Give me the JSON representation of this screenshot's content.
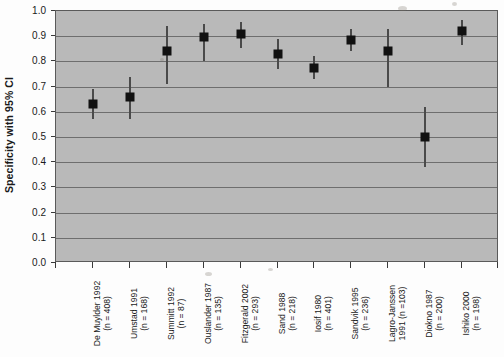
{
  "chart_data": {
    "type": "scatter",
    "title": "",
    "xlabel": "",
    "ylabel": "Specificity with 95% CI",
    "ylim": [
      0.0,
      1.0
    ],
    "ytick_labels": [
      "0.0",
      "0.1",
      "0.2",
      "0.3",
      "0.4",
      "0.5",
      "0.6",
      "0.7",
      "0.8",
      "0.9",
      "1.0"
    ],
    "ytick_values": [
      0.0,
      0.1,
      0.2,
      0.3,
      0.4,
      0.5,
      0.6,
      0.7,
      0.8,
      0.9,
      1.0
    ],
    "grid": true,
    "legend": "none",
    "marker": "filled-square",
    "error_bars": "95% CI vertical whisker-less lines",
    "categories": [
      "De Muylder 1992 (n = 408)",
      "Umstad 1991 (n = 168)",
      "Summitt 1992 (n = 87)",
      "Ouslander 1987 (n = 135)",
      "Fitzgerald 2002 (n = 293)",
      "Sand 1988 (n = 218)",
      "Iosif 1980 (n = 401)",
      "Sandvik 1995 (n = 236)",
      "Lagro-Janssen 1991 (n =103)",
      "Diokno 1987 (n = 200)",
      "Ishiko 2000 (n = 198)"
    ],
    "points": [
      {
        "label": "De Muylder 1992",
        "n": 408,
        "label_line1": "De Muylder 1992",
        "label_line2": "(n = 408)",
        "value": 0.63,
        "ci_low": 0.57,
        "ci_high": 0.69
      },
      {
        "label": "Umstad 1991",
        "n": 168,
        "label_line1": "Umstad 1991",
        "label_line2": "(n = 168)",
        "value": 0.66,
        "ci_low": 0.57,
        "ci_high": 0.74
      },
      {
        "label": "Summitt 1992",
        "n": 87,
        "label_line1": "Summitt 1992",
        "label_line2": "(n = 87)",
        "value": 0.84,
        "ci_low": 0.71,
        "ci_high": 0.94
      },
      {
        "label": "Ouslander 1987",
        "n": 135,
        "label_line1": "Ouslander 1987",
        "label_line2": "(n = 135)",
        "value": 0.895,
        "ci_low": 0.8,
        "ci_high": 0.95
      },
      {
        "label": "Fitzgerald 2002",
        "n": 293,
        "label_line1": "Fitzgerald 2002",
        "label_line2": "(n = 293)",
        "value": 0.91,
        "ci_low": 0.855,
        "ci_high": 0.955
      },
      {
        "label": "Sand 1988",
        "n": 218,
        "label_line1": "Sand 1988",
        "label_line2": "(n = 218)",
        "value": 0.83,
        "ci_low": 0.77,
        "ci_high": 0.89
      },
      {
        "label": "Iosif 1980",
        "n": 401,
        "label_line1": "Iosif 1980",
        "label_line2": "(n = 401)",
        "value": 0.775,
        "ci_low": 0.73,
        "ci_high": 0.82
      },
      {
        "label": "Sandvik 1995",
        "n": 236,
        "label_line1": "Sandvik 1995",
        "label_line2": "(n = 236)",
        "value": 0.885,
        "ci_low": 0.84,
        "ci_high": 0.93
      },
      {
        "label": "Lagro-Janssen 1991",
        "n": 103,
        "label_line1": "Lagro-Janssen",
        "label_line2": "1991 (n =103)",
        "value": 0.84,
        "ci_low": 0.7,
        "ci_high": 0.93
      },
      {
        "label": "Diokno 1987",
        "n": 200,
        "label_line1": "Diokno 1987",
        "label_line2": "(n = 200)",
        "value": 0.5,
        "ci_low": 0.38,
        "ci_high": 0.62
      },
      {
        "label": "Ishiko 2000",
        "n": 198,
        "label_line1": "Ishiko 2000",
        "label_line2": "(n = 198)",
        "value": 0.92,
        "ci_low": 0.865,
        "ci_high": 0.965
      }
    ],
    "colors": {
      "plot_background": "#b9b9b9",
      "gridline": "#6e6e6e",
      "marker": "#111111",
      "error_bar": "#4a4a4a",
      "axis": "#3a3a3a",
      "text": "#1a1a1a",
      "page_background": "#fdfdfd"
    }
  }
}
